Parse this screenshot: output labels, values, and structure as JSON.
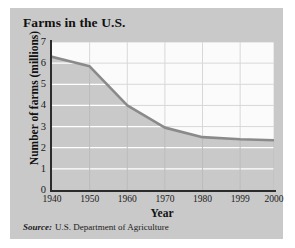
{
  "figure": {
    "title": "Farms in the U.S.",
    "source_label": "Source:",
    "source_text": "U.S. Department of Agriculture",
    "card_color": "#c9c9c9",
    "plot_bg_color": "#fbfbfb",
    "fill_color": "#c9c9c9",
    "line_color": "#8a8a8a",
    "axis_color": "#2b2b2b",
    "gridline_color_light": "#ffffff",
    "gridline_color_dark": "#d8d8d8"
  },
  "chart_data": {
    "type": "area",
    "title": "Farms in the U.S.",
    "xlabel": "Year",
    "ylabel": "Number of farms (millions)",
    "x": [
      1940,
      1950,
      1960,
      1970,
      1980,
      1999,
      2000
    ],
    "xtick_labels": [
      "1940",
      "1950",
      "1960",
      "1970",
      "1980",
      "1999",
      "2000"
    ],
    "values": [
      6.3,
      5.85,
      4.0,
      2.95,
      2.5,
      2.4,
      2.35
    ],
    "ytick_labels": [
      "0",
      "1",
      "2",
      "3",
      "4",
      "5",
      "6",
      "7"
    ],
    "ytick_values": [
      0,
      1,
      2,
      3,
      4,
      5,
      6,
      7
    ],
    "ylim": [
      0,
      7
    ],
    "xlim": [
      1940,
      2000
    ],
    "grid": true,
    "legend": "none",
    "series": [
      {
        "name": "Number of farms (millions)",
        "values": [
          6.3,
          5.85,
          4.0,
          2.95,
          2.5,
          2.4,
          2.35
        ]
      }
    ]
  }
}
